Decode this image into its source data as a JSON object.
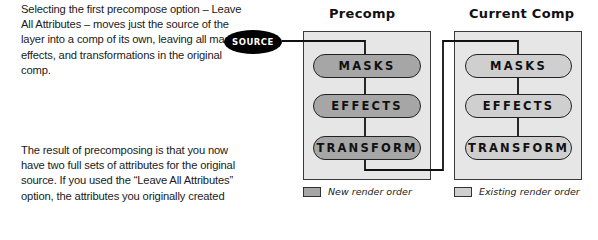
{
  "text": {
    "paragraph_1": "Selecting the first precompose option – Leave All Attributes – moves just the source of the layer into a comp of its own, leaving all masks, effects, and transformations in the original comp.",
    "paragraph_2": "The result of precomposing is that you now have two full sets of attributes for the original source. If you used the “Leave All Attributes” option, the attributes you originally created stayed in the first comp."
  },
  "diagram": {
    "source_label": "SOURCE",
    "precomp": {
      "title": "Precomp",
      "pills": [
        "MASKS",
        "EFFECTS",
        "TRANSFORM"
      ]
    },
    "current_comp": {
      "title": "Current Comp",
      "pills": [
        "MASKS",
        "EFFECTS",
        "TRANSFORM"
      ]
    },
    "legend": [
      {
        "label": "New render order",
        "color": "#a6a6a6"
      },
      {
        "label": "Existing render order",
        "color": "#cfcfcf"
      }
    ]
  }
}
